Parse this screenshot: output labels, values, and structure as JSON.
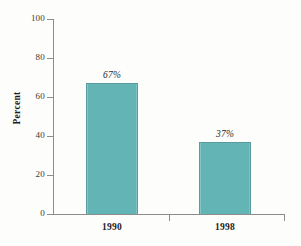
{
  "chart_data": {
    "type": "bar",
    "title": "",
    "xlabel": "",
    "ylabel": "Percent",
    "categories": [
      "1990",
      "1998"
    ],
    "values": [
      67,
      37
    ],
    "data_labels": [
      "67%",
      "37%"
    ],
    "ylim": [
      0,
      100
    ],
    "yticks": [
      0,
      20,
      40,
      60,
      80,
      100
    ],
    "ytick_labels": [
      "0",
      "20",
      "40",
      "60",
      "80",
      "100"
    ],
    "grid": false,
    "legend": null,
    "bar_color": "#63b5b5",
    "bar_edge_color": "#5a9c9e",
    "axis_color": "#8c8c8c",
    "background_color": "#fdfdfc"
  },
  "axis": {
    "y_title": "Percent",
    "ticks": [
      {
        "label": "100",
        "value": 100
      },
      {
        "label": "80",
        "value": 80
      },
      {
        "label": "60",
        "value": 60
      },
      {
        "label": "40",
        "value": 40
      },
      {
        "label": "20",
        "value": 20
      },
      {
        "label": "0",
        "value": 0
      }
    ]
  },
  "bars": [
    {
      "category": "1990",
      "value": 67,
      "label": "67%"
    },
    {
      "category": "1998",
      "value": 37,
      "label": "37%"
    }
  ]
}
